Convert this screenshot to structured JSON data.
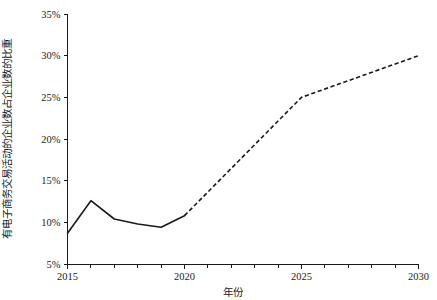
{
  "chart_data": {
    "type": "line",
    "title": "",
    "xlabel": "年份",
    "ylabel": "有电子商务交易活动的企业数占企业数的比重",
    "xlim": [
      2015,
      2030
    ],
    "ylim": [
      5,
      35
    ],
    "grid": false,
    "legend": null,
    "x_tick_labels": [
      "2015",
      "2020",
      "2025",
      "2030"
    ],
    "x_tick_values": [
      2015,
      2020,
      2025,
      2030
    ],
    "x_minor_tick_values": [
      2016,
      2017,
      2018,
      2019,
      2021,
      2022,
      2023,
      2024,
      2026,
      2027,
      2028,
      2029
    ],
    "y_tick_labels": [
      "5%",
      "10%",
      "15%",
      "20%",
      "25%",
      "30%",
      "35%"
    ],
    "y_tick_values": [
      5,
      10,
      15,
      20,
      25,
      30,
      35
    ],
    "y_unit": "%",
    "series": [
      {
        "name": "历史值",
        "style": "solid",
        "color": "#1a1a1a",
        "x": [
          2015,
          2016,
          2017,
          2018,
          2019,
          2020
        ],
        "values": [
          8.7,
          12.6,
          10.4,
          9.8,
          9.4,
          10.8
        ]
      },
      {
        "name": "预测值",
        "style": "dashed",
        "color": "#1a1a1a",
        "x": [
          2020,
          2025,
          2030
        ],
        "values": [
          10.8,
          25.0,
          30.0
        ]
      }
    ]
  }
}
